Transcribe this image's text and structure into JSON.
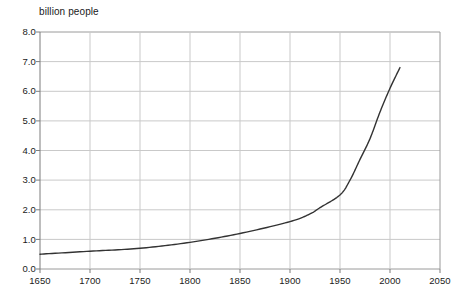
{
  "chart_data": {
    "type": "line",
    "title": "billion people",
    "xlabel": "",
    "ylabel": "billion people",
    "xlim": [
      1650,
      2050
    ],
    "ylim": [
      0.0,
      8.0
    ],
    "grid": true,
    "legend": "none",
    "x_ticks": [
      "1650",
      "1700",
      "1750",
      "1800",
      "1850",
      "1900",
      "1950",
      "2000",
      "2050"
    ],
    "y_ticks": [
      "0.0",
      "1.0",
      "2.0",
      "3.0",
      "4.0",
      "5.0",
      "6.0",
      "7.0",
      "8.0"
    ],
    "series": [
      {
        "name": "world population",
        "color": "#333333",
        "x": [
          1650,
          1700,
          1750,
          1800,
          1850,
          1900,
          1920,
          1930,
          1950,
          1960,
          1970,
          1980,
          1990,
          2000,
          2010
        ],
        "values": [
          0.5,
          0.6,
          0.7,
          0.9,
          1.2,
          1.6,
          1.86,
          2.07,
          2.5,
          3.0,
          3.7,
          4.4,
          5.3,
          6.1,
          6.8
        ]
      }
    ]
  },
  "axes": {
    "title_text": "billion people",
    "y_labels": [
      "8.0",
      "7.0",
      "6.0",
      "5.0",
      "4.0",
      "3.0",
      "2.0",
      "1.0",
      "0.0"
    ],
    "x_labels": [
      "1650",
      "1700",
      "1750",
      "1800",
      "1850",
      "1900",
      "1950",
      "2000",
      "2050"
    ]
  },
  "colors": {
    "grid": "#c9c9c9",
    "frame": "#9a9a9a",
    "curve": "#333333",
    "text": "#1a1a1a",
    "background": "#ffffff"
  }
}
